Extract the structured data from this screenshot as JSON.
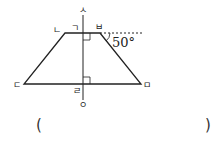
{
  "figure": {
    "type": "trapezoid-with-perpendicular-axis",
    "labels": {
      "top_axis": "ㅅ",
      "top_foot": "ㄱ",
      "top_left": "ㄴ",
      "top_right": "ㅂ",
      "bottom_left": "ㄷ",
      "bottom_foot": "ㄹ",
      "bottom_right": "ㅁ",
      "bottom_axis": "ㅇ"
    },
    "angle_label": "50°",
    "colors": {
      "stroke": "#222222",
      "background": "#ffffff"
    }
  },
  "answer": {
    "open_paren": "(",
    "close_paren": ")",
    "value": ""
  }
}
